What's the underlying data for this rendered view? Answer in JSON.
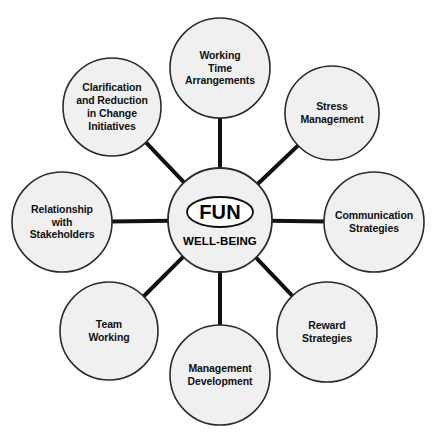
{
  "diagram": {
    "type": "hub-and-spoke",
    "background_color": "#ffffff",
    "circle_fill": "#f0f0f0",
    "circle_stroke": "#2b2b2b",
    "connector_color": "#111111",
    "hub": {
      "title": "FUN",
      "subtitle": "WELL-BEING",
      "center_x": 220,
      "center_y": 220,
      "radius": 52,
      "ellipse_rx": 33,
      "ellipse_ry": 15
    },
    "spokes": [
      {
        "id": "working-time-arrangements",
        "label": "Working\nTime\nArrangements",
        "center_x": 220,
        "center_y": 68,
        "radius": 50,
        "angle_deg": 90
      },
      {
        "id": "stress-management",
        "label": "Stress\nManagement",
        "center_x": 332,
        "center_y": 113,
        "radius": 47,
        "angle_deg": 45
      },
      {
        "id": "communication-strategies",
        "label": "Communication\nStrategies",
        "center_x": 374,
        "center_y": 222,
        "radius": 50,
        "angle_deg": 0
      },
      {
        "id": "reward-strategies",
        "label": "Reward\nStrategies",
        "center_x": 327,
        "center_y": 332,
        "radius": 50,
        "angle_deg": -45
      },
      {
        "id": "management-development",
        "label": "Management\nDevelopment",
        "center_x": 220,
        "center_y": 375,
        "radius": 50,
        "angle_deg": -90
      },
      {
        "id": "team-working",
        "label": "Team\nWorking",
        "center_x": 109,
        "center_y": 331,
        "radius": 49,
        "angle_deg": -135
      },
      {
        "id": "relationship-with-stakeholders",
        "label": "Relationship\nwith\nStakeholders",
        "center_x": 62,
        "center_y": 222,
        "radius": 50,
        "angle_deg": 180
      },
      {
        "id": "clarification-and-reduction-in-change-initiatives",
        "label": "Clarification\nand Reduction\nin Change\nInitiatives",
        "center_x": 112,
        "center_y": 107,
        "radius": 49,
        "angle_deg": 135
      }
    ]
  }
}
